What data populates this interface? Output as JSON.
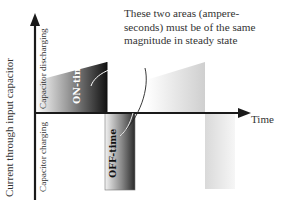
{
  "annotation": {
    "lines": [
      "These two areas (ampere-",
      "seconds) must be of the same",
      "magnitude in steady state"
    ]
  },
  "axes": {
    "x_label": "Time",
    "y_label": "Current through input capacitor",
    "y_positive_label": "Capacitor discharging",
    "y_negative_label": "Capacitor charging"
  },
  "regions": {
    "on_time_label": "ON-time",
    "off_time_label": "OFF-time"
  },
  "colors": {
    "axis": "#1a1a1a",
    "dark_fill": "#1c1c1c",
    "light_fill": "#d6d6d6",
    "text": "#333333"
  }
}
